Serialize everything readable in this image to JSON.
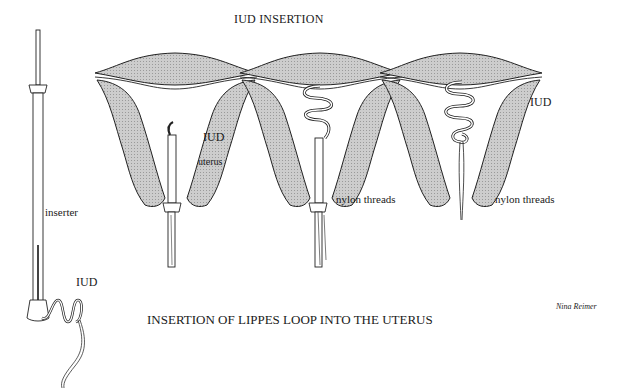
{
  "title": "IUD INSERTION",
  "caption": "INSERTION OF LIPPES LOOP INTO THE UTERUS",
  "credit": "Nina Reimer",
  "colors": {
    "tissue_fill": "#c8c8c8",
    "line": "#222222",
    "background": "#ffffff"
  },
  "inserter_panel": {
    "labels": {
      "inserter": "inserter",
      "iud": "IUD"
    }
  },
  "stages": [
    {
      "step": 1,
      "labels": {
        "iud": "IUD",
        "uterus": "uterus"
      }
    },
    {
      "step": 2,
      "labels": {
        "threads": "nylon threads"
      }
    },
    {
      "step": 3,
      "labels": {
        "iud": "IUD",
        "threads": "nylon threads"
      }
    }
  ]
}
